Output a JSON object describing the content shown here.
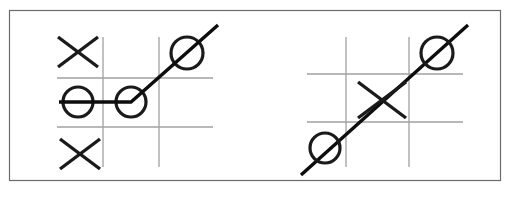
{
  "figure": {
    "width": 510,
    "height": 200,
    "background_color": "#ffffff",
    "border_color": "#6b6b6b",
    "grid_color": "#a0a0a0",
    "mark_color": "#1a1a1a",
    "win_line_color": "#0d0d0d"
  },
  "panels": [
    {
      "id": "left-board",
      "label": "Left board",
      "description": "Tic-tac-toe board with a bent winning line through three O marks",
      "grid": {
        "x_left": 57,
        "x_right": 213,
        "y_top": 37,
        "y_bottom": 167,
        "vertical_lines_x": [
          103,
          159
        ],
        "horizontal_lines_y": [
          78,
          127
        ]
      },
      "cells": [
        {
          "row": 0,
          "col": 0,
          "mark": "X",
          "cx": 78,
          "cy": 52,
          "size": 20
        },
        {
          "row": 0,
          "col": 1,
          "mark": "",
          "cx": 131,
          "cy": 52,
          "size": 20
        },
        {
          "row": 0,
          "col": 2,
          "mark": "O",
          "cx": 187,
          "cy": 53,
          "size": 16
        },
        {
          "row": 1,
          "col": 0,
          "mark": "O",
          "cx": 78,
          "cy": 102,
          "size": 15
        },
        {
          "row": 1,
          "col": 1,
          "mark": "O",
          "cx": 131,
          "cy": 102,
          "size": 15
        },
        {
          "row": 1,
          "col": 2,
          "mark": "",
          "cx": 187,
          "cy": 102,
          "size": 15
        },
        {
          "row": 2,
          "col": 0,
          "mark": "X",
          "cx": 80,
          "cy": 154,
          "size": 20
        },
        {
          "row": 2,
          "col": 1,
          "mark": "",
          "cx": 131,
          "cy": 154,
          "size": 20
        },
        {
          "row": 2,
          "col": 2,
          "mark": "",
          "cx": 187,
          "cy": 154,
          "size": 20
        }
      ],
      "win_line": {
        "shape": "bent",
        "points": "59,102 131,102 218,25",
        "winner": "O",
        "cells_covered": [
          {
            "row": 1,
            "col": 0
          },
          {
            "row": 1,
            "col": 1
          },
          {
            "row": 0,
            "col": 2
          }
        ]
      }
    },
    {
      "id": "right-board",
      "label": "Right board",
      "description": "Tic-tac-toe board with a straight diagonal winning line through two O marks and a center X",
      "grid": {
        "x_left": 307,
        "x_right": 463,
        "y_top": 37,
        "y_bottom": 167,
        "vertical_lines_x": [
          346,
          409
        ],
        "horizontal_lines_y": [
          74,
          122
        ]
      },
      "cells": [
        {
          "row": 0,
          "col": 0,
          "mark": "",
          "cx": 326,
          "cy": 55,
          "size": 20
        },
        {
          "row": 0,
          "col": 1,
          "mark": "",
          "cx": 377,
          "cy": 55,
          "size": 20
        },
        {
          "row": 0,
          "col": 2,
          "mark": "O",
          "cx": 437,
          "cy": 53,
          "size": 16
        },
        {
          "row": 1,
          "col": 0,
          "mark": "",
          "cx": 326,
          "cy": 98,
          "size": 20
        },
        {
          "row": 1,
          "col": 1,
          "mark": "X",
          "cx": 382,
          "cy": 100,
          "size": 24
        },
        {
          "row": 1,
          "col": 2,
          "mark": "",
          "cx": 437,
          "cy": 98,
          "size": 20
        },
        {
          "row": 2,
          "col": 0,
          "mark": "O",
          "cx": 325,
          "cy": 148,
          "size": 15
        },
        {
          "row": 2,
          "col": 1,
          "mark": "",
          "cx": 377,
          "cy": 145,
          "size": 20
        },
        {
          "row": 2,
          "col": 2,
          "mark": "",
          "cx": 437,
          "cy": 145,
          "size": 20
        }
      ],
      "win_line": {
        "shape": "straight",
        "points": "301,175 468,25",
        "winner": "O",
        "cells_covered": [
          {
            "row": 2,
            "col": 0
          },
          {
            "row": 1,
            "col": 1
          },
          {
            "row": 0,
            "col": 2
          }
        ]
      }
    }
  ]
}
